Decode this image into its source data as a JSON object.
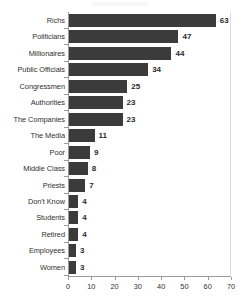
{
  "chart_data": {
    "type": "bar",
    "orientation": "horizontal",
    "title": "",
    "xlabel": "",
    "ylabel": "",
    "xlim": [
      0,
      70
    ],
    "xticks": [
      0,
      10,
      20,
      30,
      40,
      50,
      60,
      70
    ],
    "grid": false,
    "legend": false,
    "bar_color": "#3b3b3b",
    "axis_color": "#9a9a9a",
    "text_color": "#2f2f2f",
    "categories": [
      "Richs",
      "Politicians",
      "Millionaires",
      "Public Officials",
      "Congressmen",
      "Authorities",
      "The Companies",
      "The Media",
      "Poor",
      "Middle Class",
      "Priests",
      "Don't Know",
      "Students",
      "Retired",
      "Employees",
      "Women"
    ],
    "values": [
      63,
      47,
      44,
      34,
      25,
      23,
      23,
      11,
      9,
      8,
      7,
      4,
      4,
      4,
      3,
      3
    ],
    "data_labels": [
      "63",
      "47",
      "44",
      "34",
      "25",
      "23",
      "23",
      "11",
      "9",
      "8",
      "7",
      "4",
      "4",
      "4",
      "3",
      "3"
    ]
  }
}
